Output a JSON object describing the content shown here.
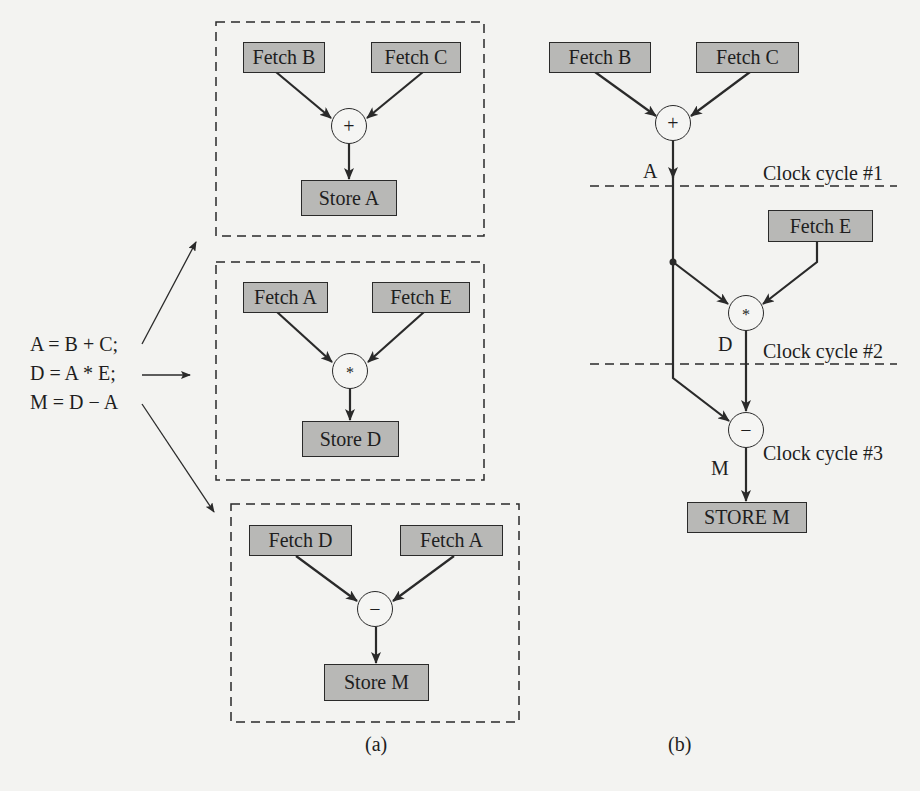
{
  "equations": [
    "A = B + C;",
    "D = A * E;",
    "M = D − A"
  ],
  "part_a": {
    "caption": "(a)",
    "panels": [
      {
        "inputs": [
          "Fetch B",
          "Fetch C"
        ],
        "operator": "+",
        "output": "Store A"
      },
      {
        "inputs": [
          "Fetch A",
          "Fetch E"
        ],
        "operator": "*",
        "output": "Store D"
      },
      {
        "inputs": [
          "Fetch D",
          "Fetch A"
        ],
        "operator": "−",
        "output": "Store M"
      }
    ]
  },
  "part_b": {
    "caption": "(b)",
    "inputs": [
      "Fetch B",
      "Fetch C"
    ],
    "op_add": "+",
    "signal_a": "A",
    "clock1": "Clock cycle #1",
    "fetch_e": "Fetch E",
    "op_mul": "*",
    "signal_d": "D",
    "clock2": "Clock cycle #2",
    "op_sub": "−",
    "clock3": "Clock cycle #3",
    "signal_m": "M",
    "output": "STORE M"
  },
  "colors": {
    "box_fill": "#b8b8b6",
    "line": "#2a2a2a",
    "background": "#f3f3f1"
  }
}
